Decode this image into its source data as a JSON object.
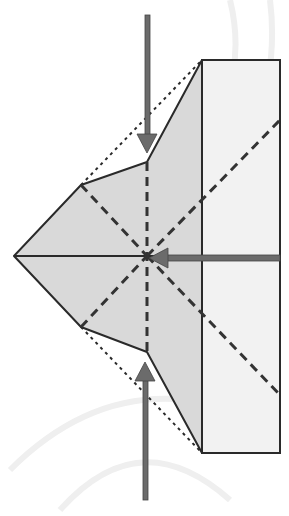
{
  "diagram": {
    "type": "origami-fold-instruction",
    "colors": {
      "background": "#ffffff",
      "paper_shaded": "#d9d9d9",
      "paper_light": "#f2f2f2",
      "outline": "#2a2a2a",
      "valley_fold": "#333333",
      "arrow": "#6b6b6b",
      "watermark": "#ececec"
    },
    "shapes": {
      "rectangle_flap": {
        "x": 202,
        "y": 60,
        "width": 78,
        "height": 393
      },
      "shaded_kite_points": "14,256 81,185 147,162 202,60 202,453 147,352 81,327",
      "left_tip": [
        14,
        256
      ],
      "upper_left_vertex": [
        81,
        185
      ],
      "lower_left_vertex": [
        81,
        327
      ],
      "upper_notch": [
        147,
        162
      ],
      "lower_notch": [
        147,
        352
      ],
      "center_point": [
        147,
        256
      ]
    },
    "fold_lines": {
      "dotted": [
        {
          "from": [
            81,
            185
          ],
          "to": [
            202,
            60
          ]
        },
        {
          "from": [
            81,
            327
          ],
          "to": [
            202,
            453
          ]
        }
      ],
      "dashed": [
        {
          "from": [
            147,
            162
          ],
          "to": [
            147,
            352
          ]
        },
        {
          "from": [
            81,
            185
          ],
          "to": [
            147,
            256
          ]
        },
        {
          "from": [
            81,
            327
          ],
          "to": [
            147,
            256
          ]
        },
        {
          "from": [
            147,
            256
          ],
          "to": [
            280,
            120
          ]
        },
        {
          "from": [
            147,
            256
          ],
          "to": [
            280,
            395
          ]
        }
      ]
    },
    "arrows": [
      {
        "name": "push-down-arrow",
        "from": [
          147,
          15
        ],
        "to": [
          147,
          152
        ],
        "direction": "down"
      },
      {
        "name": "push-up-arrow",
        "from": [
          145,
          500
        ],
        "to": [
          145,
          362
        ],
        "direction": "up"
      },
      {
        "name": "push-left-arrow",
        "from": [
          280,
          258
        ],
        "to": [
          150,
          258
        ],
        "direction": "left"
      }
    ]
  }
}
